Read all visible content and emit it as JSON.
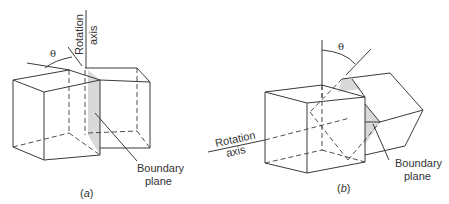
{
  "figure": {
    "panels": [
      {
        "id": "a",
        "caption": "(a)",
        "caption_letter": "a",
        "angle_symbol": "θ",
        "rotation_axis_label_line1": "Rotation",
        "rotation_axis_label_line2": "axis",
        "boundary_label_line1": "Boundary",
        "boundary_label_line2": "plane",
        "boundary_type": "tilt"
      },
      {
        "id": "b",
        "caption": "(b)",
        "caption_letter": "b",
        "angle_symbol": "θ",
        "rotation_axis_label_line1": "Rotation",
        "rotation_axis_label_line2": "axis",
        "boundary_label_line1": "Boundary",
        "boundary_label_line2": "plane",
        "boundary_type": "twist"
      }
    ],
    "colors": {
      "line": "#3a3a3a",
      "boundary_shade": "#d9d9d9",
      "background": "#ffffff"
    }
  }
}
